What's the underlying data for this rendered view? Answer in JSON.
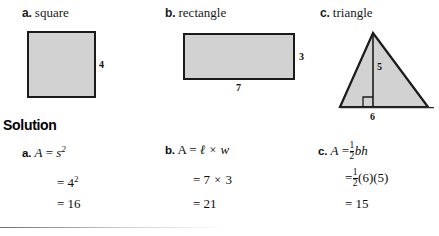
{
  "problems": [
    {
      "tag": "a.",
      "name": "square"
    },
    {
      "tag": "b.",
      "name": "rectangle"
    },
    {
      "tag": "c.",
      "name": "triangle"
    }
  ],
  "figures": {
    "square": {
      "side_label": "4"
    },
    "rectangle": {
      "height_label": "3",
      "width_label": "7"
    },
    "triangle": {
      "height_label": "5",
      "base_label": "6"
    }
  },
  "solution": {
    "heading": "Solution",
    "columns": [
      {
        "tag": "a.",
        "formula_var": "A",
        "formula_eq": "=",
        "formula_body_base": "s",
        "formula_body_exp": "2",
        "line2_eq": "=",
        "line2_base": "4",
        "line2_exp": "2",
        "line3_eq": "=",
        "line3_value": "16"
      },
      {
        "tag": "b.",
        "formula_var": "A",
        "formula_eq": "=",
        "formula_len": "ℓ",
        "formula_times": "×",
        "formula_wid": "w",
        "line2_eq": "=",
        "line2_a": "7",
        "line2_times": "×",
        "line2_b": "3",
        "line3_eq": "=",
        "line3_value": "21"
      },
      {
        "tag": "c.",
        "formula_var": "A",
        "formula_eq": "=",
        "frac_num": "1",
        "frac_den": "2",
        "formula_body": "bh",
        "line2_eq": "=",
        "line2_frac_num": "1",
        "line2_frac_den": "2",
        "line2_body": "(6)(5)",
        "line3_eq": "=",
        "line3_value": "15"
      }
    ]
  },
  "colors": {
    "shape_fill": "#d2d2d2",
    "shape_stroke": "#1b1b1b",
    "text": "#0d0d0d"
  }
}
